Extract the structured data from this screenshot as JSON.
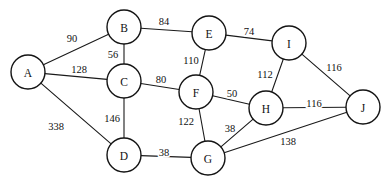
{
  "figure": {
    "background_color": "#ffffff",
    "node_fill_color": "#ffffff",
    "node_stroke_color": "#141414",
    "edge_color": "#1a1a1a",
    "text_color": "#111111",
    "width": 388,
    "height": 189
  },
  "chart_data": {
    "type": "diagram",
    "graph_type": "weighted-undirected-graph",
    "title": "",
    "node_count": 10,
    "edge_count": 17,
    "nodes": [
      {
        "id": "A",
        "label": "A",
        "x": 28,
        "y": 72,
        "r": 17
      },
      {
        "id": "B",
        "label": "B",
        "x": 124,
        "y": 27,
        "r": 17
      },
      {
        "id": "C",
        "label": "C",
        "x": 124,
        "y": 81,
        "r": 17
      },
      {
        "id": "D",
        "label": "D",
        "x": 124,
        "y": 155,
        "r": 17
      },
      {
        "id": "E",
        "label": "E",
        "x": 209,
        "y": 33,
        "r": 17
      },
      {
        "id": "F",
        "label": "F",
        "x": 196,
        "y": 92,
        "r": 17
      },
      {
        "id": "G",
        "label": "G",
        "x": 208,
        "y": 158,
        "r": 17
      },
      {
        "id": "H",
        "label": "H",
        "x": 266,
        "y": 108,
        "r": 17
      },
      {
        "id": "I",
        "label": "I",
        "x": 289,
        "y": 43,
        "r": 17
      },
      {
        "id": "J",
        "label": "J",
        "x": 363,
        "y": 107,
        "r": 17
      }
    ],
    "edges": [
      {
        "source": "A",
        "target": "B",
        "weight": 90,
        "label": "90",
        "label_x": 72,
        "label_y": 38
      },
      {
        "source": "A",
        "target": "C",
        "weight": 128,
        "label": "128",
        "label_x": 79,
        "label_y": 69
      },
      {
        "source": "A",
        "target": "D",
        "weight": 338,
        "label": "338",
        "label_x": 56,
        "label_y": 126
      },
      {
        "source": "B",
        "target": "C",
        "weight": 56,
        "label": "56",
        "label_x": 113,
        "label_y": 54
      },
      {
        "source": "B",
        "target": "E",
        "weight": 84,
        "label": "84",
        "label_x": 164,
        "label_y": 21
      },
      {
        "source": "C",
        "target": "D",
        "weight": 146,
        "label": "146",
        "label_x": 112,
        "label_y": 118
      },
      {
        "source": "C",
        "target": "F",
        "weight": 80,
        "label": "80",
        "label_x": 161,
        "label_y": 79
      },
      {
        "source": "E",
        "target": "F",
        "weight": 110,
        "label": "110",
        "label_x": 191,
        "label_y": 60
      },
      {
        "source": "E",
        "target": "I",
        "weight": 74,
        "label": "74",
        "label_x": 249,
        "label_y": 31
      },
      {
        "source": "F",
        "target": "H",
        "weight": 50,
        "label": "50",
        "label_x": 232,
        "label_y": 93
      },
      {
        "source": "F",
        "target": "G",
        "weight": 122,
        "label": "122",
        "label_x": 186,
        "label_y": 121
      },
      {
        "source": "D",
        "target": "G",
        "weight": 38,
        "label": "38",
        "label_x": 164,
        "label_y": 152
      },
      {
        "source": "G",
        "target": "H",
        "weight": 38,
        "label": "38",
        "label_x": 230,
        "label_y": 128
      },
      {
        "source": "G",
        "target": "J",
        "weight": 138,
        "label": "138",
        "label_x": 288,
        "label_y": 141
      },
      {
        "source": "H",
        "target": "I",
        "weight": 112,
        "label": "112",
        "label_x": 265,
        "label_y": 74
      },
      {
        "source": "H",
        "target": "J",
        "weight": 116,
        "label": "116",
        "label_x": 314,
        "label_y": 103
      },
      {
        "source": "I",
        "target": "J",
        "weight": 116,
        "label": "116",
        "label_x": 334,
        "label_y": 67
      }
    ]
  }
}
